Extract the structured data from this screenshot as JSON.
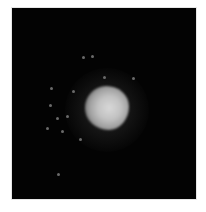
{
  "image": {
    "description": "Grayscale dark-field microscopy-style image of a bright fuzzy blob with scattered faint specks",
    "background_color": "#030303",
    "page_background": "#ffffff",
    "blob": {
      "center": [
        105,
        108
      ],
      "core_diameter": 40,
      "halo_diameter": 80,
      "color": "#d0d0d0"
    },
    "specks": [
      [
        83,
        57
      ],
      [
        92,
        56
      ],
      [
        51,
        88
      ],
      [
        50,
        105
      ],
      [
        47,
        128
      ],
      [
        57,
        118
      ],
      [
        67,
        116
      ],
      [
        73,
        91
      ],
      [
        104,
        77
      ],
      [
        62,
        131
      ],
      [
        58,
        174
      ],
      [
        80,
        139
      ],
      [
        133,
        78
      ]
    ]
  }
}
